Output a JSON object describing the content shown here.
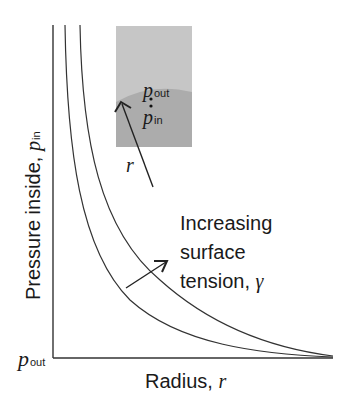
{
  "diagram": {
    "y_axis_label": "Pressure inside, ",
    "y_axis_symbol": "p",
    "y_axis_subscript": "in",
    "y_origin_symbol": "p",
    "y_origin_subscript": "out",
    "x_axis_label": "Radius, ",
    "x_axis_symbol": "r",
    "annotation_line1": "Increasing",
    "annotation_line2": "surface",
    "annotation_line3": "tension, ",
    "annotation_symbol": "γ",
    "inset": {
      "outside_symbol": "p",
      "outside_subscript": "out",
      "inside_symbol": "p",
      "inside_subscript": "in",
      "radius_symbol": "r",
      "outside_color": "#c4c4c4",
      "inside_color": "#a8a8a8"
    },
    "curves": [
      "lower surface tension",
      "higher surface tension"
    ],
    "line_color": "#333333"
  }
}
